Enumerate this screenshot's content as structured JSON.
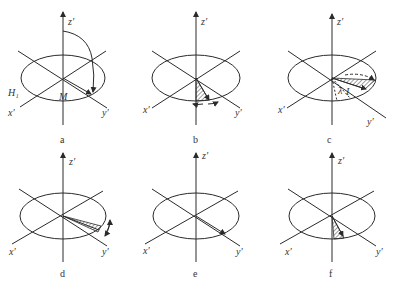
{
  "figure": {
    "panels": [
      {
        "id": "a",
        "caption": "a",
        "labels": {
          "z": "z′",
          "x": "x′",
          "y": "y′",
          "H": "H₁",
          "M": "M"
        }
      },
      {
        "id": "b",
        "caption": "b",
        "labels": {
          "z": "z′",
          "x": "x′",
          "y": "y′"
        }
      },
      {
        "id": "c",
        "caption": "c",
        "labels": {
          "z": "z′",
          "x": "x′",
          "y": "y′",
          "angle": "λ",
          "angle_mark": "I"
        }
      },
      {
        "id": "d",
        "caption": "d",
        "labels": {
          "z": "z′",
          "x": "x′",
          "y": "y′"
        }
      },
      {
        "id": "e",
        "caption": "e",
        "labels": {
          "z": "z′",
          "x": "x′",
          "y": "y′"
        }
      },
      {
        "id": "f",
        "caption": "f",
        "labels": {
          "z": "z′",
          "x": "x′",
          "y": "y′"
        }
      }
    ],
    "line_color": "#2a2a2a"
  }
}
